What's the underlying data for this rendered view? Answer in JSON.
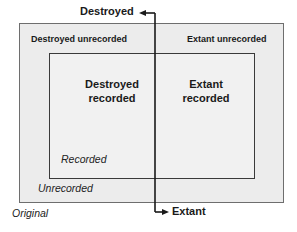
{
  "diagram": {
    "axis": {
      "top_label": "Destroyed",
      "bottom_label": "Extant"
    },
    "regions": {
      "destroyed_unrecorded": "Destroyed unrecorded",
      "extant_unrecorded": "Extant unrecorded",
      "destroyed_recorded_line1": "Destroyed",
      "destroyed_recorded_line2": "recorded",
      "extant_recorded_line1": "Extant",
      "extant_recorded_line2": "recorded"
    },
    "box_labels": {
      "recorded": "Recorded",
      "unrecorded": "Unrecorded",
      "original": "Original"
    },
    "colors": {
      "outer_fill": "#ececec",
      "inner_fill": "#f1f1f1",
      "line": "#1a1a1a"
    }
  }
}
